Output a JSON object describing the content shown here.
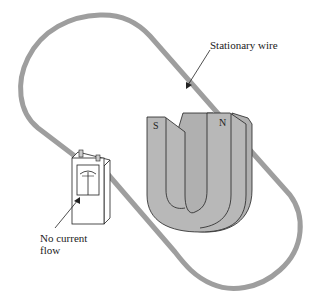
{
  "figure": {
    "labels": {
      "wire": "Stationary wire",
      "meter_line1": "No current",
      "meter_line2": "flow"
    },
    "magnet": {
      "south_pole": "S",
      "north_pole": "N"
    },
    "colors": {
      "wire": "#9e9e9e",
      "magnet_fill": "#b8b8b8",
      "outline": "#222222",
      "background": "#ffffff"
    }
  }
}
